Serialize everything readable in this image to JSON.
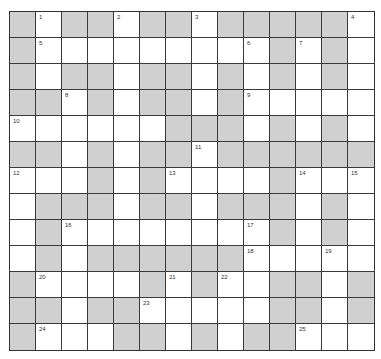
{
  "puzzle": {
    "rows": 13,
    "cols": 14,
    "colors": {
      "block": "#d0d0d0",
      "open": "#ffffff",
      "line": "#3a3a3a"
    },
    "grid": [
      "#.##.##.#####.",
      "#.........#.#.",
      "#.##.##.#.#.#.",
      "##.#.##.#.....",
      "......###.#.#.",
      "##.#.##.######",
      "...#.#....#...",
      ".###.##.###.#.",
      ".#........#.#.",
      ".#.######.....",
      "#....#.#..##.#",
      "##.##.....##.#",
      "#...##.#.##..."
    ],
    "numbers": [
      {
        "r": 0,
        "c": 1,
        "n": "1"
      },
      {
        "r": 0,
        "c": 4,
        "n": "2"
      },
      {
        "r": 0,
        "c": 7,
        "n": "3"
      },
      {
        "r": 0,
        "c": 13,
        "n": "4"
      },
      {
        "r": 1,
        "c": 1,
        "n": "5"
      },
      {
        "r": 1,
        "c": 9,
        "n": "6"
      },
      {
        "r": 1,
        "c": 11,
        "n": "7"
      },
      {
        "r": 3,
        "c": 2,
        "n": "8"
      },
      {
        "r": 3,
        "c": 9,
        "n": "9"
      },
      {
        "r": 4,
        "c": 0,
        "n": "10"
      },
      {
        "r": 5,
        "c": 7,
        "n": "11"
      },
      {
        "r": 6,
        "c": 0,
        "n": "12"
      },
      {
        "r": 6,
        "c": 6,
        "n": "13"
      },
      {
        "r": 6,
        "c": 11,
        "n": "14"
      },
      {
        "r": 6,
        "c": 13,
        "n": "15"
      },
      {
        "r": 8,
        "c": 2,
        "n": "16"
      },
      {
        "r": 8,
        "c": 9,
        "n": "17"
      },
      {
        "r": 9,
        "c": 9,
        "n": "18"
      },
      {
        "r": 9,
        "c": 12,
        "n": "19"
      },
      {
        "r": 10,
        "c": 1,
        "n": "20"
      },
      {
        "r": 10,
        "c": 6,
        "n": "21"
      },
      {
        "r": 10,
        "c": 8,
        "n": "22"
      },
      {
        "r": 11,
        "c": 5,
        "n": "23"
      },
      {
        "r": 12,
        "c": 1,
        "n": "24"
      },
      {
        "r": 12,
        "c": 11,
        "n": "25"
      }
    ]
  }
}
